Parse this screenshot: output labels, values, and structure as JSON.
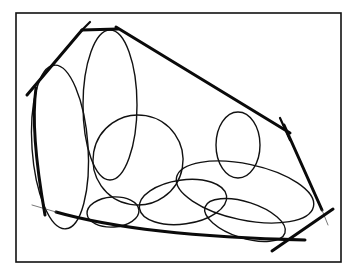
{
  "figure": {
    "frame": {
      "x": 16,
      "y": 13,
      "width": 325,
      "height": 249,
      "stroke": "#111111"
    },
    "hull": {
      "stroke": "#0a0a0a",
      "points": [
        [
          27,
          95
        ],
        [
          82,
          30
        ],
        [
          118,
          29
        ],
        [
          290,
          133
        ],
        [
          321,
          230
        ],
        [
          303,
          247
        ],
        [
          42,
          213
        ],
        [
          34,
          165
        ]
      ]
    },
    "ellipses": [
      {
        "id": "e1",
        "cx": 60,
        "cy": 147,
        "rx": 28,
        "ry": 82,
        "rotate": -4
      },
      {
        "id": "e2",
        "cx": 110,
        "cy": 105,
        "rx": 27,
        "ry": 75,
        "rotate": 0
      },
      {
        "id": "e3",
        "cx": 138,
        "cy": 160,
        "rx": 45,
        "ry": 45,
        "rotate": 10
      },
      {
        "id": "e4",
        "cx": 238,
        "cy": 145,
        "rx": 22,
        "ry": 33,
        "rotate": 0
      },
      {
        "id": "e5",
        "cx": 245,
        "cy": 192,
        "rx": 70,
        "ry": 28,
        "rotate": 12
      },
      {
        "id": "e6",
        "cx": 113,
        "cy": 212,
        "rx": 26,
        "ry": 15,
        "rotate": -4
      },
      {
        "id": "e7",
        "cx": 183,
        "cy": 202,
        "rx": 44,
        "ry": 22,
        "rotate": -8
      },
      {
        "id": "e8",
        "cx": 245,
        "cy": 220,
        "rx": 42,
        "ry": 18,
        "rotate": 18
      }
    ]
  }
}
